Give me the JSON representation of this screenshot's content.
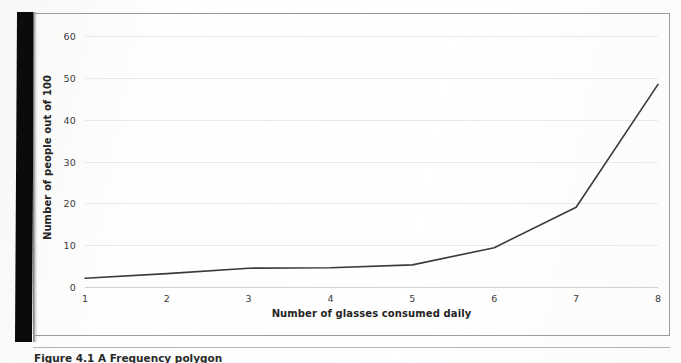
{
  "figure": {
    "caption": "Figure 4.1  A Frequency polygon",
    "background_color": "#ffffff",
    "frame_color": "#9b9b9b",
    "gutter_color": "#0b0b0b"
  },
  "chart_data": {
    "type": "line",
    "title": "",
    "subtitle": "",
    "xlabel": "Number of glasses consumed daily",
    "ylabel": "Number of people out of 100",
    "x": [
      1,
      2,
      3,
      4,
      5,
      6,
      7,
      8
    ],
    "values": [
      2.1,
      3.2,
      4.5,
      4.6,
      5.3,
      9.4,
      19.1,
      48.5
    ],
    "xticklabels": [
      "1",
      "2",
      "3",
      "4",
      "5",
      "6",
      "7",
      "8"
    ],
    "yticklabels": [
      "0",
      "10",
      "20",
      "30",
      "40",
      "50",
      "60"
    ],
    "yticks": [
      0,
      10,
      20,
      30,
      40,
      50,
      60
    ],
    "xlim": [
      1,
      8
    ],
    "ylim": [
      0,
      62
    ],
    "grid": "horizontal",
    "legend": "none",
    "line_color": "#3a3a3a",
    "line_width": 1.6,
    "markers": "none",
    "annotations": []
  }
}
